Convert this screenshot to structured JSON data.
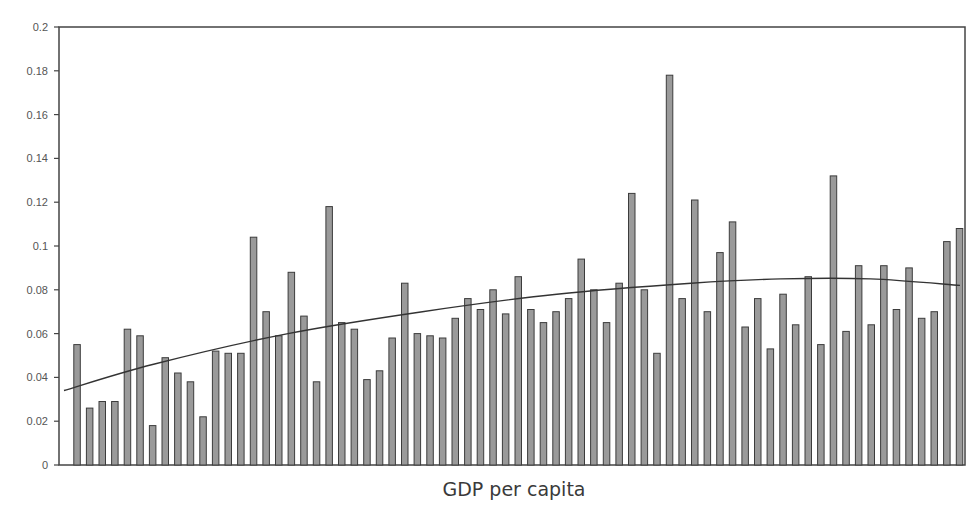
{
  "chart_data": {
    "type": "bar",
    "title": "",
    "xlabel": "GDP per capita",
    "ylabel": "",
    "ylim": [
      0,
      0.2
    ],
    "yticks": [
      0,
      0.02,
      0.04,
      0.06,
      0.08,
      0.1,
      0.12,
      0.14,
      0.16,
      0.18,
      0.2
    ],
    "ytick_labels": [
      "0",
      "0.02",
      "0.04",
      "0.06",
      "0.08",
      "0.1",
      "0.12",
      "0.14",
      "0.16",
      "0.18",
      "0.2"
    ],
    "grid": false,
    "legend": null,
    "categories_note": "71 unlabeled bars ordered by GDP per capita",
    "values": [
      0.055,
      0.026,
      0.029,
      0.029,
      0.062,
      0.059,
      0.018,
      0.049,
      0.042,
      0.038,
      0.022,
      0.052,
      0.051,
      0.051,
      0.104,
      0.07,
      0.059,
      0.088,
      0.068,
      0.038,
      0.118,
      0.065,
      0.062,
      0.039,
      0.043,
      0.058,
      0.083,
      0.06,
      0.059,
      0.058,
      0.067,
      0.076,
      0.071,
      0.08,
      0.069,
      0.086,
      0.071,
      0.065,
      0.07,
      0.076,
      0.094,
      0.08,
      0.065,
      0.083,
      0.124,
      0.08,
      0.051,
      0.178,
      0.076,
      0.121,
      0.07,
      0.097,
      0.111,
      0.063,
      0.076,
      0.053,
      0.078,
      0.064,
      0.086,
      0.055,
      0.132,
      0.061,
      0.091,
      0.064,
      0.091,
      0.071,
      0.09,
      0.067,
      0.07,
      0.102,
      0.108
    ],
    "trendline": {
      "type": "polynomial",
      "points": [
        {
          "x_frac": 0.0,
          "y": 0.034
        },
        {
          "x_frac": 0.1,
          "y": 0.046
        },
        {
          "x_frac": 0.25,
          "y": 0.06
        },
        {
          "x_frac": 0.4,
          "y": 0.07
        },
        {
          "x_frac": 0.55,
          "y": 0.078
        },
        {
          "x_frac": 0.7,
          "y": 0.083
        },
        {
          "x_frac": 0.8,
          "y": 0.085
        },
        {
          "x_frac": 0.9,
          "y": 0.085
        },
        {
          "x_frac": 1.0,
          "y": 0.082
        }
      ]
    },
    "colors": {
      "bar_fill": "#9a9a9a",
      "bar_stroke": "#3c3c3c",
      "axis": "#444444",
      "trendline": "#333333"
    }
  }
}
